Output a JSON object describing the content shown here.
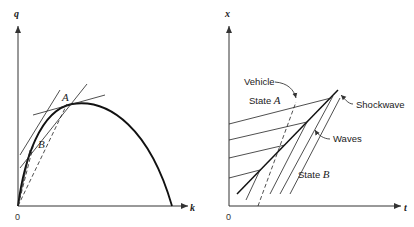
{
  "left_panel": {
    "title": "flow-density diagram",
    "y_axis_label": "q",
    "x_axis_label": "k",
    "origin_label": "0",
    "point_a_label": "A",
    "point_b_label": "B"
  },
  "right_panel": {
    "title": "time-space diagram",
    "y_axis_label": "x",
    "x_axis_label": "t",
    "origin_label": "0",
    "labels": {
      "vehicle": "Vehicle",
      "state_a_prefix": "State ",
      "state_a_var": "A",
      "shockwave": "Shockwave",
      "waves": "Waves",
      "state_b_prefix": "State ",
      "state_b_var": "B"
    }
  }
}
